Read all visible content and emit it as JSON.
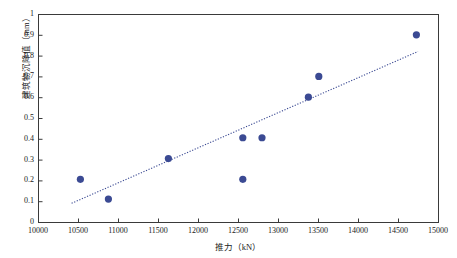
{
  "chart_data": {
    "type": "scatter",
    "title": "",
    "xlabel": "推力（kN）",
    "ylabel": "建筑物沉降值（mm）",
    "xlim": [
      10000,
      15000
    ],
    "ylim": [
      0,
      1
    ],
    "xticks": [
      10000,
      10500,
      11000,
      11500,
      12000,
      12500,
      13000,
      13500,
      14000,
      14500,
      15000
    ],
    "xtick_labels": [
      "10000",
      "10500",
      "11000",
      "11500",
      "12000",
      "12500",
      "13000",
      "13500",
      "14000",
      "14500",
      "15000"
    ],
    "yticks": [
      0,
      0.1,
      0.2,
      0.3,
      0.4,
      0.5,
      0.6,
      0.7,
      0.8,
      0.9,
      1
    ],
    "ytick_labels": [
      "0",
      "0.1",
      "0.2",
      "0.3",
      "0.4",
      "0.5",
      "0.6",
      "0.7",
      "0.8",
      "0.9",
      "1"
    ],
    "grid": false,
    "legend": null,
    "marker_color": "#3b4a93",
    "trendline_color": "#3b4a93",
    "axis_color": "#3a3a3a",
    "points": [
      {
        "x": 10530,
        "y": 0.205
      },
      {
        "x": 10880,
        "y": 0.11
      },
      {
        "x": 11630,
        "y": 0.305
      },
      {
        "x": 12560,
        "y": 0.405
      },
      {
        "x": 12560,
        "y": 0.205
      },
      {
        "x": 12800,
        "y": 0.405
      },
      {
        "x": 13380,
        "y": 0.6
      },
      {
        "x": 13510,
        "y": 0.7
      },
      {
        "x": 14730,
        "y": 0.9
      }
    ],
    "trendline": {
      "style": "dotted",
      "x_start": 10420,
      "y_start": 0.09,
      "x_end": 14750,
      "y_end": 0.82
    }
  }
}
